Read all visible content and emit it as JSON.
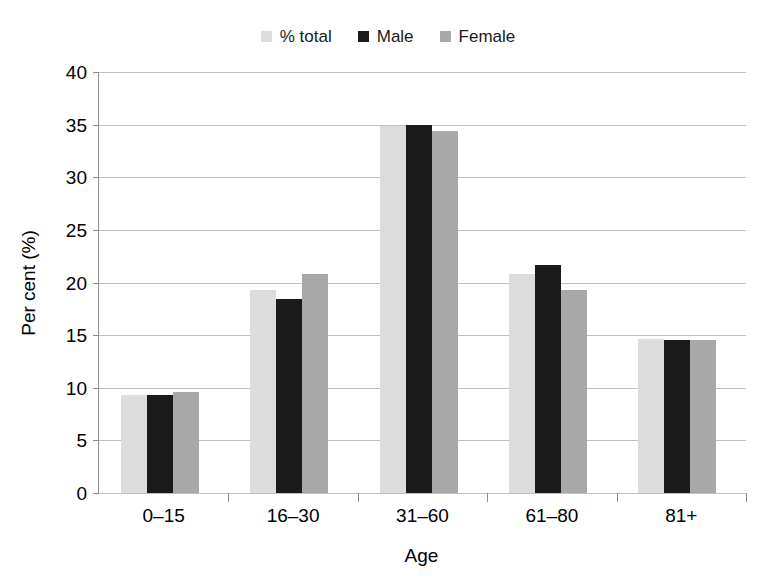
{
  "chart_data": {
    "type": "bar",
    "title": "",
    "subtitle": "",
    "xlabel": "Age",
    "ylabel": "Per cent (%)",
    "categories": [
      "0–15",
      "16–30",
      "31–60",
      "61–80",
      "81+"
    ],
    "ylim": [
      0,
      40
    ],
    "yticks": [
      0,
      5,
      10,
      15,
      20,
      25,
      30,
      35,
      40
    ],
    "ytick_labels": [
      "0",
      "5",
      "10",
      "15",
      "20",
      "25",
      "30",
      "35",
      "40"
    ],
    "grid": true,
    "legend_position": "top-center",
    "series": [
      {
        "name": "% total",
        "color": "#dcdcdc",
        "values": [
          9.3,
          19.3,
          34.9,
          20.8,
          14.6
        ]
      },
      {
        "name": "Male",
        "color": "#1a1a1a",
        "values": [
          9.3,
          18.4,
          35.0,
          21.7,
          14.5
        ]
      },
      {
        "name": "Female",
        "color": "#a8a8a8",
        "values": [
          9.6,
          20.8,
          34.4,
          19.3,
          14.5
        ]
      }
    ]
  },
  "colors": {
    "background": "#ffffff",
    "axis": "#8c8c8c",
    "gridline": "#bfbfbf",
    "text": "#000000",
    "percent_total": "#dcdcdc",
    "male": "#1a1a1a",
    "female": "#a8a8a8"
  }
}
